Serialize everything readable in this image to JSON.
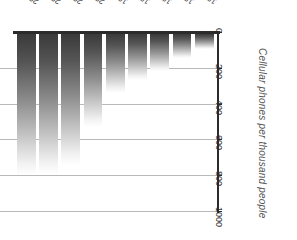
{
  "chart_data": {
    "type": "bar",
    "title": "",
    "xlabel": "",
    "ylabel": "Cellular phones per thousand people",
    "orientation": "inverted-vertical",
    "grid": true,
    "legend": false,
    "ylim": [
      0,
      1000
    ],
    "yticks": [
      0,
      200,
      400,
      600,
      800,
      1000
    ],
    "ytick_labels": [
      "0",
      "200",
      "400",
      "600",
      "800",
      "1000"
    ],
    "categories": [
      "2003",
      "2002",
      "2001",
      "2000",
      "1999",
      "1998",
      "1997",
      "1996",
      "1995"
    ],
    "values": [
      790,
      780,
      730,
      520,
      330,
      255,
      205,
      135,
      85
    ],
    "series": [
      {
        "name": "Cellular phones per thousand people",
        "values": [
          790,
          780,
          730,
          520,
          330,
          255,
          205,
          135,
          85
        ]
      }
    ],
    "bars": [
      {
        "category": "2003",
        "value": 790
      },
      {
        "category": "2002",
        "value": 780
      },
      {
        "category": "2001",
        "value": 730
      },
      {
        "category": "2000",
        "value": 520
      },
      {
        "category": "1999",
        "value": 330
      },
      {
        "category": "1998",
        "value": 255
      },
      {
        "category": "1997",
        "value": 205
      },
      {
        "category": "1996",
        "value": 135
      },
      {
        "category": "1995",
        "value": 85
      }
    ],
    "colors": {
      "axis": "#2b2b2b",
      "grid": "#b9b9b9",
      "bar_top": "#3a3a3a",
      "bar_bottom": "#ffffff",
      "text": "#2c2c2c",
      "title_text": "#555555",
      "background": "#ffffff"
    }
  }
}
